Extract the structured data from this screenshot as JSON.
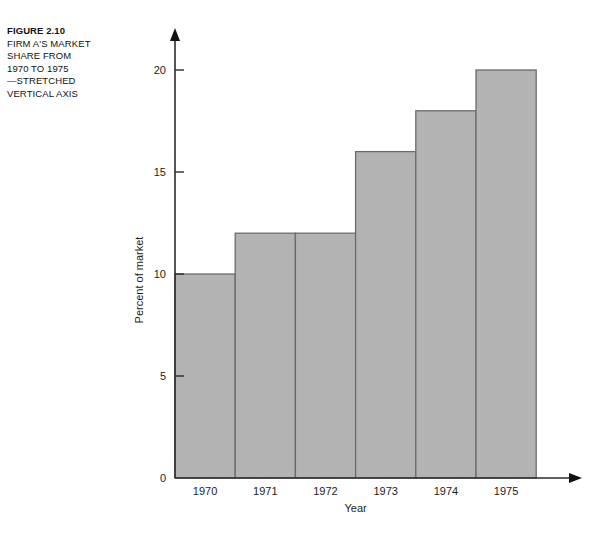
{
  "caption": {
    "lines": [
      "FIGURE 2.10",
      "FIRM A'S MARKET",
      "SHARE FROM",
      "1970 TO 1975",
      "—STRETCHED",
      "VERTICAL AXIS"
    ]
  },
  "chart_data": {
    "type": "bar",
    "title": "",
    "categories": [
      "1970",
      "1971",
      "1972",
      "1973",
      "1974",
      "1975"
    ],
    "values": [
      10,
      12,
      12,
      16,
      18,
      20
    ],
    "xlabel": "Year",
    "ylabel": "Percent of market",
    "ylim": [
      0,
      21.5
    ],
    "yticks": [
      0,
      5,
      10,
      15,
      20
    ],
    "ytick_labels": [
      "0",
      "5",
      "10",
      "15",
      "20"
    ],
    "grid": false,
    "legend": false,
    "bar_fill_color": "#b3b3b3",
    "bar_border_color": "#6b6b6b",
    "axis_color": "#2b2b2b",
    "bars_contiguous": true,
    "axis_arrowheads": true
  }
}
